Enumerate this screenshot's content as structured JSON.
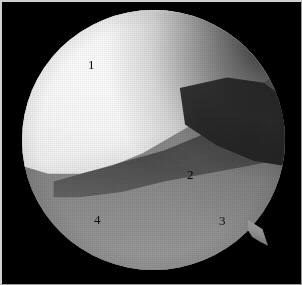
{
  "figure": {
    "kind": "arthroscopic-photograph",
    "frame_background": "#000000",
    "frame_border_color": "#cfcfcf",
    "field_of_view": {
      "shape": "circle",
      "center_x": 151,
      "center_y": 138,
      "radius": 131,
      "has_rim_notch": true,
      "rim_notch_position": "lower-right"
    },
    "labels": [
      {
        "id": "1",
        "text": "1",
        "x": 90,
        "y": 63,
        "region": "bright-condyle-upper-left"
      },
      {
        "id": "2",
        "text": "2",
        "x": 189,
        "y": 173,
        "region": "joint-space-shadow"
      },
      {
        "id": "3",
        "text": "3",
        "x": 221,
        "y": 219,
        "region": "lower-tissue-right"
      },
      {
        "id": "4",
        "text": "4",
        "x": 96,
        "y": 218,
        "region": "lower-tissue-left"
      }
    ],
    "regions": {
      "condyle_label": "1",
      "crevice_label": "2",
      "lower_right_label": "3",
      "lower_left_label": "4"
    },
    "tones": {
      "highlight": "#ffffff",
      "condyle_mid": "#e2e2e2",
      "tissue_mid": "#949494",
      "tissue_dark": "#6f6f6f",
      "shadow": "#0a0a0a",
      "background": "#000000"
    }
  }
}
